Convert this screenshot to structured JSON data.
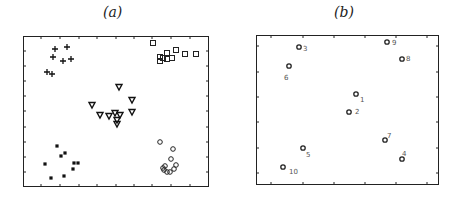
{
  "panels": [
    {
      "title": "(a)",
      "frame": {
        "x": 23,
        "y": 36,
        "w": 186,
        "h": 151
      },
      "ticks_x": [
        41,
        60,
        79,
        97,
        116,
        134,
        152,
        171,
        190
      ],
      "ticks_y": [
        51,
        66,
        81,
        96,
        111,
        127,
        142,
        157,
        172
      ],
      "groups": [
        {
          "marker": "plus",
          "points": [
            [
              55,
              49
            ],
            [
              53,
              57
            ],
            [
              63,
              61
            ],
            [
              67,
              47
            ],
            [
              71,
              59
            ],
            [
              47,
              72
            ],
            [
              52,
              74
            ]
          ]
        },
        {
          "marker": "square",
          "points": [
            [
              153,
              43
            ],
            [
              160,
              57
            ],
            [
              160,
              61
            ],
            [
              167,
              53
            ],
            [
              167,
              59
            ],
            [
              172,
              58
            ],
            [
              176,
              50
            ],
            [
              185,
              54
            ],
            [
              196,
              54
            ],
            [
              163,
              58
            ]
          ]
        },
        {
          "marker": "triangle",
          "points": [
            [
              119,
              87
            ],
            [
              132,
              100
            ],
            [
              92,
              105
            ],
            [
              100,
              115
            ],
            [
              109,
              116
            ],
            [
              115,
              113
            ],
            [
              120,
              115
            ],
            [
              132,
              112
            ],
            [
              117,
              120
            ],
            [
              117,
              124
            ]
          ]
        },
        {
          "marker": "filled-square",
          "points": [
            [
              57,
              146
            ],
            [
              61,
              156
            ],
            [
              65,
              153
            ],
            [
              45,
              164
            ],
            [
              74,
              163
            ],
            [
              78,
              163
            ],
            [
              73,
              169
            ],
            [
              51,
              178
            ],
            [
              64,
              176
            ]
          ]
        },
        {
          "marker": "circle",
          "points": [
            [
              160,
              142
            ],
            [
              173,
              149
            ],
            [
              171,
              159
            ],
            [
              165,
              166
            ],
            [
              164,
              170
            ],
            [
              167,
              172
            ],
            [
              170,
              172
            ],
            [
              174,
              169
            ],
            [
              176,
              165
            ],
            [
              163,
              168
            ]
          ]
        }
      ]
    },
    {
      "title": "(b)",
      "frame": {
        "x": 256,
        "y": 35,
        "w": 183,
        "h": 150
      },
      "ticks_x": [
        271,
        303,
        334,
        365,
        396,
        427
      ],
      "ticks_y": [
        46,
        72,
        97,
        122,
        148,
        173
      ],
      "points": [
        {
          "label": "1",
          "x": 356,
          "y": 94,
          "lx": 360,
          "ly": 99
        },
        {
          "label": "2",
          "x": 349,
          "y": 112,
          "lx": 355,
          "ly": 111
        },
        {
          "label": "3",
          "x": 299,
          "y": 47,
          "lx": 303,
          "ly": 48
        },
        {
          "label": "4",
          "x": 402,
          "y": 159,
          "lx": 402,
          "ly": 153
        },
        {
          "label": "5",
          "x": 303,
          "y": 148,
          "lx": 306,
          "ly": 154
        },
        {
          "label": "6",
          "x": 289,
          "y": 66,
          "lx": 284,
          "ly": 77
        },
        {
          "label": "7",
          "x": 385,
          "y": 140,
          "lx": 387,
          "ly": 135
        },
        {
          "label": "8",
          "x": 402,
          "y": 59,
          "lx": 406,
          "ly": 58
        },
        {
          "label": "9",
          "x": 387,
          "y": 42,
          "lx": 392,
          "ly": 42
        },
        {
          "label": "10",
          "x": 283,
          "y": 167,
          "lx": 289,
          "ly": 171
        }
      ]
    }
  ]
}
